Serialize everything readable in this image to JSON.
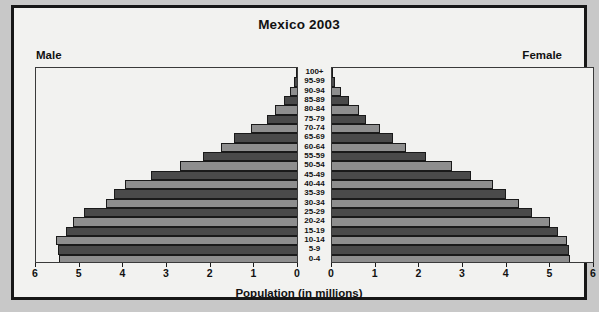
{
  "chart_title": "Mexico 2003",
  "side_labels": {
    "left": "Male",
    "right": "Female"
  },
  "axis": {
    "xlabel": "Population (in millions)",
    "left_ticks": [
      "6",
      "5",
      "4",
      "3",
      "2",
      "1",
      "0"
    ],
    "right_ticks": [
      "0",
      "1",
      "2",
      "3",
      "4",
      "5",
      "6"
    ],
    "max": 6,
    "grid": false
  },
  "colors": {
    "bar_light": "#8e8e8e",
    "bar_dark": "#4a4a4a",
    "outline": "#1a1a1a",
    "panel_bg": "#f2f2f0",
    "page_bg": "#c8c8c8"
  },
  "chart_data": {
    "type": "bar",
    "title": "Mexico 2003",
    "subtitle": "",
    "xlabel": "Population (in millions)",
    "ylabel": "",
    "orientation": "population-pyramid",
    "xlim": [
      0,
      6
    ],
    "categories": [
      "100+",
      "95-99",
      "90-94",
      "85-89",
      "80-84",
      "75-79",
      "70-74",
      "65-69",
      "60-64",
      "55-59",
      "50-54",
      "45-49",
      "40-44",
      "35-39",
      "30-34",
      "25-29",
      "20-24",
      "15-19",
      "10-14",
      "5-9",
      "0-4"
    ],
    "series": [
      {
        "name": "Male",
        "side": "left",
        "values": [
          0.02,
          0.06,
          0.15,
          0.3,
          0.5,
          0.7,
          1.05,
          1.45,
          1.75,
          2.15,
          2.7,
          3.35,
          3.95,
          4.2,
          4.4,
          4.9,
          5.15,
          5.3,
          5.55,
          5.5,
          5.48
        ]
      },
      {
        "name": "Female",
        "side": "right",
        "values": [
          0.03,
          0.08,
          0.2,
          0.4,
          0.62,
          0.78,
          1.1,
          1.4,
          1.7,
          2.15,
          2.75,
          3.2,
          3.7,
          4.0,
          4.3,
          4.6,
          5.0,
          5.2,
          5.4,
          5.45,
          5.48
        ]
      }
    ],
    "legend_position": "none"
  }
}
